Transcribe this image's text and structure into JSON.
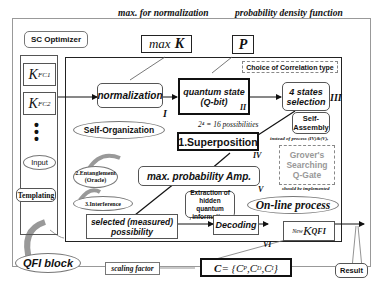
{
  "diagram": {
    "sc_optimizer": {
      "label": "SC Optimizer",
      "items": [
        "K_FC1",
        "K_FC2",
        "⋮",
        "Input"
      ],
      "k_fc1_base": "K",
      "k_fc1_sub": "FC1",
      "k_fc2_base": "K",
      "k_fc2_sub": "FC2",
      "input_label": "Input"
    },
    "templating_label": "Templating",
    "qfi_block_label": "QFI block",
    "max_norm": {
      "caption": "max. for normalization",
      "label_prefix": "max",
      "label_var": "K"
    },
    "pdf": {
      "caption": "probability density function",
      "label": "P"
    },
    "correlation_choice": "Choice of Correlation type",
    "steps": {
      "normalization": {
        "label": "normalization",
        "numeral": "I"
      },
      "quantum_state": {
        "line1": "quantum state",
        "line2": "(Q-bit)",
        "numeral": "II"
      },
      "four_states": {
        "line1": "4 states",
        "line2": "selection",
        "numeral": "III"
      },
      "superposition": {
        "label": "1.Superposition",
        "numeral": "IV",
        "caption": "2⁴ = 16 possibilities"
      },
      "max_prob": {
        "label": "max. probability Amp.",
        "numeral": "V"
      },
      "selected": {
        "line1": "selected (measured)",
        "line2": "possibility"
      },
      "decoding": {
        "label": "Decoding",
        "numeral": "VI"
      },
      "new_k": {
        "prefix": "New",
        "base": "K",
        "sub": "QFI"
      }
    },
    "self_organization": "Self-Organization",
    "entanglement": {
      "line1": "2.Entanglement",
      "line2": "(Oracle)"
    },
    "interference": "3.Interference",
    "self_assembly": {
      "line1": "Self-",
      "line2": "Assembly"
    },
    "instead_note": "instead of process (IV)&(V),",
    "grover": {
      "line1": "Grover's",
      "line2": "Searching",
      "line3": "Q-Gate"
    },
    "implemented_note": "should be implemented",
    "online_process": "On-line process",
    "extraction": {
      "line1": "Extraction of",
      "line2": "hidden quantum",
      "line3": "information"
    },
    "scaling_factor": "scaling factor",
    "c_formula": "C = {C_P, C_D, C_I}",
    "c_formula_display": {
      "lhs": "C",
      "eq": " = {",
      "p": "P",
      "d": "D",
      "i": "I",
      "close": "}"
    },
    "result": "Result",
    "colors": {
      "border_dark": "#111111",
      "border_gray": "#888888",
      "grover_text": "#999999",
      "arrow_gray": "#a0a0a0"
    }
  }
}
